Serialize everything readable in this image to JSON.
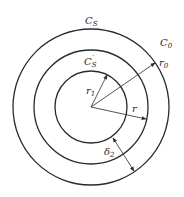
{
  "diagram": {
    "center": {
      "x": 91,
      "y": 107
    },
    "circles": [
      {
        "id": "C0",
        "radius": 78
      },
      {
        "id": "Cs",
        "radius": 57
      },
      {
        "id": "Cs_prime",
        "radius": 36
      }
    ],
    "labels": {
      "C_s": {
        "base": "C",
        "sub": "S",
        "sup": ""
      },
      "C_0": {
        "base": "C",
        "sub": "0",
        "sup": ""
      },
      "C_s_prime": {
        "base": "C",
        "sub": "S",
        "sup": "′"
      },
      "r_0": {
        "base": "r",
        "sub": "0"
      },
      "r_1": {
        "base": "r",
        "sub": "1"
      },
      "r": {
        "base": "r",
        "sub": ""
      },
      "delta_2": {
        "base": "δ",
        "sub": "2"
      }
    },
    "stroke_color": "#2a2a2a",
    "background": "#ffffff"
  }
}
